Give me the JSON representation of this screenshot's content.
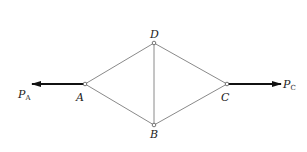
{
  "diagram": {
    "type": "truss",
    "nodes": [
      {
        "id": "A",
        "label": "A",
        "x": 85,
        "y": 84
      },
      {
        "id": "D",
        "label": "D",
        "x": 154,
        "y": 43
      },
      {
        "id": "B",
        "label": "B",
        "x": 154,
        "y": 125
      },
      {
        "id": "C",
        "label": "C",
        "x": 227,
        "y": 84
      }
    ],
    "members": [
      {
        "from": "A",
        "to": "D"
      },
      {
        "from": "A",
        "to": "B"
      },
      {
        "from": "D",
        "to": "C"
      },
      {
        "from": "B",
        "to": "C"
      },
      {
        "from": "D",
        "to": "B"
      }
    ],
    "forces": [
      {
        "name": "P_A",
        "label_main": "P",
        "label_sub": "A",
        "at": "A",
        "direction": "left"
      },
      {
        "name": "P_C",
        "label_main": "P",
        "label_sub": "C",
        "at": "C",
        "direction": "right"
      }
    ],
    "colors": {
      "member": "#8a8a8a",
      "force": "#111111",
      "node": "#555555"
    }
  }
}
